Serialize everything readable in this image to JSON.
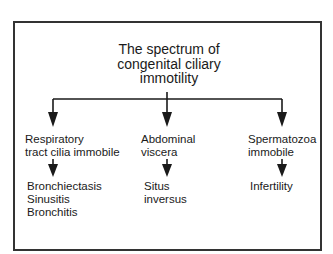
{
  "diagram": {
    "title_lines": [
      "The spectrum of",
      "congenital ciliary",
      "immotility"
    ],
    "branches": [
      {
        "cause_lines": [
          "Respiratory",
          "tract cilia immobile"
        ],
        "effect_lines": [
          "Bronchiectasis",
          "Sinusitis",
          "Bronchitis"
        ]
      },
      {
        "cause_lines": [
          "Abdominal",
          "viscera"
        ],
        "effect_lines": [
          "Situs",
          "inversus"
        ]
      },
      {
        "cause_lines": [
          "Spermatozoa",
          "immobile"
        ],
        "effect_lines": [
          "Infertility"
        ]
      }
    ],
    "colors": {
      "line": "#1a1a1a",
      "frame": "#333333",
      "background": "#ffffff"
    }
  }
}
